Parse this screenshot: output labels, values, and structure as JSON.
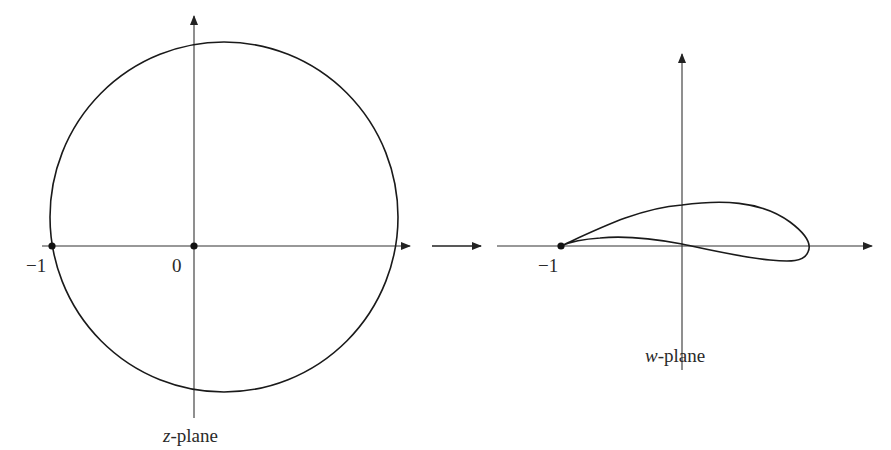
{
  "figure": {
    "z_plane": {
      "label_var": "z",
      "label_rest": "-plane",
      "point_labels": {
        "minus_one": "−1",
        "origin": "0"
      },
      "marked_points": [
        "-1",
        "0"
      ]
    },
    "mapping_arrow": {
      "direction": "right"
    },
    "w_plane": {
      "label_var": "w",
      "label_rest": "-plane",
      "point_labels": {
        "minus_one": "−1"
      },
      "marked_points": [
        "-1"
      ],
      "curve": "airfoil"
    },
    "colors": {
      "stroke": "#1a1a1a",
      "axis": "#333333",
      "text": "#2a2a2a"
    }
  }
}
